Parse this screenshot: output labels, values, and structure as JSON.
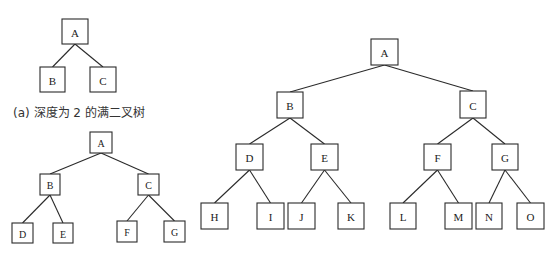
{
  "diagrams": [
    {
      "id": "a",
      "caption": "(a) 深度为 2 的满二叉树",
      "nodes": [
        "A",
        "B",
        "C"
      ],
      "edges": [
        [
          "A",
          "B"
        ],
        [
          "A",
          "C"
        ]
      ]
    },
    {
      "id": "b",
      "caption": "",
      "nodes": [
        "A",
        "B",
        "C",
        "D",
        "E",
        "F",
        "G"
      ],
      "edges": [
        [
          "A",
          "B"
        ],
        [
          "A",
          "C"
        ],
        [
          "B",
          "D"
        ],
        [
          "B",
          "E"
        ],
        [
          "C",
          "F"
        ],
        [
          "C",
          "G"
        ]
      ]
    },
    {
      "id": "c",
      "caption": "",
      "nodes": [
        "A",
        "B",
        "C",
        "D",
        "E",
        "F",
        "G",
        "H",
        "I",
        "J",
        "K",
        "L",
        "M",
        "N",
        "O"
      ],
      "edges": [
        [
          "A",
          "B"
        ],
        [
          "A",
          "C"
        ],
        [
          "B",
          "D"
        ],
        [
          "B",
          "E"
        ],
        [
          "C",
          "F"
        ],
        [
          "C",
          "G"
        ],
        [
          "D",
          "H"
        ],
        [
          "D",
          "I"
        ],
        [
          "E",
          "J"
        ],
        [
          "E",
          "K"
        ],
        [
          "F",
          "L"
        ],
        [
          "F",
          "M"
        ],
        [
          "G",
          "N"
        ],
        [
          "G",
          "O"
        ]
      ]
    }
  ]
}
